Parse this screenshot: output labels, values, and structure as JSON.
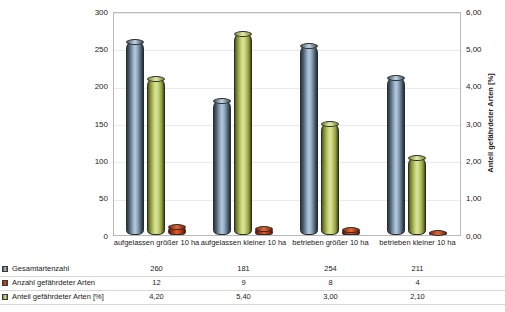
{
  "chart_data": {
    "type": "bar",
    "title": "",
    "categories": [
      "aufgelassen größer 10 ha",
      "aufgelassen kleiner 10 ha",
      "betrieben größer 10 ha",
      "betrieben kleiner 10 ha"
    ],
    "series": [
      {
        "name": "Gesamtartenzahl",
        "axis": "left",
        "color": "#8ea7bd",
        "values": [
          260,
          181,
          254,
          211
        ],
        "value_labels": [
          "260",
          "181",
          "254",
          "211"
        ]
      },
      {
        "name": "Anzahl gefährdeter Arten",
        "axis": "left",
        "color": "#c4441a",
        "values": [
          12,
          9,
          8,
          4
        ],
        "value_labels": [
          "12",
          "9",
          "8",
          "4"
        ]
      },
      {
        "name": "Anteil gefährdeter Arten [%]",
        "axis": "right",
        "color": "#c3cf73",
        "values": [
          4.2,
          5.4,
          3.0,
          2.1
        ],
        "value_labels": [
          "4,20",
          "5,40",
          "3,00",
          "2,10"
        ]
      }
    ],
    "plot_order": [
      "Gesamtartenzahl",
      "Anteil gefährdeter Arten [%]",
      "Anzahl gefährdeter Arten"
    ],
    "ylabel": "Artenzahl",
    "ylim": [
      0,
      300
    ],
    "yticks": [
      0,
      50,
      100,
      150,
      200,
      250,
      300
    ],
    "ytick_labels": [
      "0",
      "50",
      "100",
      "150",
      "200",
      "250",
      "300"
    ],
    "y2label": "Anteil gefährdeter Arten [%]",
    "y2lim": [
      0,
      6
    ],
    "y2ticks": [
      0,
      1,
      2,
      3,
      4,
      5,
      6
    ],
    "y2tick_labels": [
      "0,00",
      "1,00",
      "2,00",
      "3,00",
      "4,00",
      "5,00",
      "6,00"
    ],
    "xlabel": "",
    "grid": true,
    "legend_position": "bottom-table"
  },
  "data_table": {
    "rows": [
      {
        "label": "Gesamtartenzahl",
        "swatch": "blue",
        "cells": [
          "260",
          "181",
          "254",
          "211"
        ]
      },
      {
        "label": "Anzahl gefährdeter Arten",
        "swatch": "red",
        "cells": [
          "12",
          "9",
          "8",
          "4"
        ]
      },
      {
        "label": "Anteil gefährdeter Arten [%]",
        "swatch": "olive",
        "cells": [
          "4,20",
          "5,40",
          "3,00",
          "2,10"
        ]
      }
    ]
  }
}
